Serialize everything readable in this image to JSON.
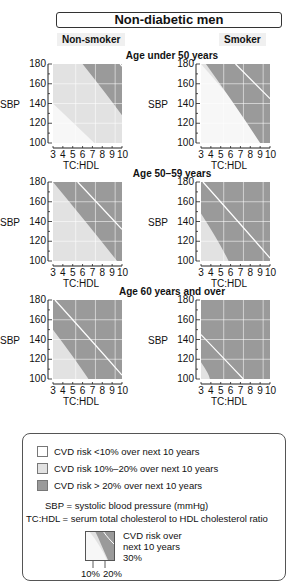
{
  "title": "Non-diabetic men",
  "columns": {
    "left": "Non-smoker",
    "right": "Smoker"
  },
  "age_groups": [
    "Age under 50 years",
    "Age 50–59 years",
    "Age 60 years and over"
  ],
  "axis": {
    "y_ticks": [
      "180",
      "160",
      "140",
      "120",
      "100"
    ],
    "y_label": "SBP",
    "x_ticks": [
      "3",
      "4",
      "5",
      "6",
      "7",
      "8",
      "9",
      "10"
    ],
    "x_label": "TC:HDL"
  },
  "colors": {
    "low": "#f7f7f7",
    "mid": "#e2e2e2",
    "high": "#9a9a9a",
    "line": "#ffffff"
  },
  "legend": {
    "items": [
      {
        "label": "CVD risk <10% over next 10 years",
        "color": "#ffffff"
      },
      {
        "label": "CVD risk 10%–20% over next 10 years",
        "color": "#e2e2e2"
      },
      {
        "label": "CVD risk > 20% over next 10 years",
        "color": "#9a9a9a"
      }
    ],
    "sbp_note": "SBP = systolic blood pressure (mmHg)",
    "tchdl_note": "TC:HDL = serum total cholesterol to HDL  cholesterol ratio",
    "mini_title_1": "CVD risk over",
    "mini_title_2": "next 10 years",
    "mini_30": "30%",
    "mini_10": "10%",
    "mini_20": "20%"
  },
  "chart_data": [
    {
      "type": "area",
      "title": "Age under 50 years — Non-smoker",
      "xlabel": "TC:HDL",
      "ylabel": "SBP",
      "xlim": [
        3,
        10
      ],
      "ylim": [
        100,
        180
      ],
      "boundaries": {
        "10%": [
          [
            3,
            140
          ],
          [
            7.2,
            100
          ]
        ],
        "20%": [
          [
            6,
            180
          ],
          [
            10,
            128
          ]
        ],
        "30%": [
          [
            9.8,
            180
          ],
          [
            10,
            178
          ]
        ]
      }
    },
    {
      "type": "area",
      "title": "Age under 50 years — Smoker",
      "xlabel": "TC:HDL",
      "ylabel": "SBP",
      "xlim": [
        3,
        10
      ],
      "ylim": [
        100,
        180
      ],
      "boundaries": {
        "10%": [
          [
            3,
            180
          ],
          [
            3,
            180
          ]
        ],
        "20%": [
          [
            3.5,
            180
          ],
          [
            9,
            100
          ]
        ],
        "30%": [
          [
            6.5,
            180
          ],
          [
            10,
            145
          ]
        ]
      }
    },
    {
      "type": "area",
      "title": "Age 50–59 years — Non-smoker",
      "xlabel": "TC:HDL",
      "ylabel": "SBP",
      "xlim": [
        3,
        10
      ],
      "ylim": [
        100,
        180
      ],
      "boundaries": {
        "20%": [
          [
            3,
            180
          ],
          [
            9.5,
            100
          ]
        ],
        "30%": [
          [
            5.5,
            180
          ],
          [
            10,
            132
          ]
        ]
      }
    },
    {
      "type": "area",
      "title": "Age 50–59 years — Smoker",
      "xlabel": "TC:HDL",
      "ylabel": "SBP",
      "xlim": [
        3,
        10
      ],
      "ylim": [
        100,
        180
      ],
      "boundaries": {
        "20%": [
          [
            3,
            148
          ],
          [
            5.8,
            100
          ]
        ],
        "30%": [
          [
            3.2,
            180
          ],
          [
            10,
            103
          ]
        ]
      }
    },
    {
      "type": "area",
      "title": "Age 60 years and over — Non-smoker",
      "xlabel": "TC:HDL",
      "ylabel": "SBP",
      "xlim": [
        3,
        10
      ],
      "ylim": [
        100,
        180
      ],
      "boundaries": {
        "20%": [
          [
            3,
            150
          ],
          [
            6.6,
            100
          ]
        ],
        "30%": [
          [
            3.2,
            180
          ],
          [
            10,
            104
          ]
        ]
      }
    },
    {
      "type": "area",
      "title": "Age 60 years and over — Smoker",
      "xlabel": "TC:HDL",
      "ylabel": "SBP",
      "xlim": [
        3,
        10
      ],
      "ylim": [
        100,
        180
      ],
      "boundaries": {
        "20%": [
          [
            3,
            117
          ],
          [
            3.9,
            100
          ]
        ],
        "30%": [
          [
            3,
            145
          ],
          [
            7.3,
            100
          ]
        ]
      }
    }
  ]
}
